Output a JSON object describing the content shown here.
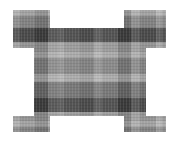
{
  "image": {
    "title": "Grayscale plaid textured cross shape",
    "width": 176,
    "height": 145,
    "background_color": "#ffffff",
    "description": "A square block of black-and-white tartan/plaid fabric texture with rectangular notches cut out of the centre of each of its four sides, forming a cross / plus-like silhouette.",
    "alt_text": "Plaid patterned cross shape on white background"
  },
  "shape": {
    "name": "notched-square-cross",
    "outer_bounds": {
      "x": 13,
      "y": 10,
      "width": 153,
      "height": 122
    },
    "notches": [
      {
        "side": "top",
        "x": 50,
        "y": 10,
        "width": 74,
        "height": 18
      },
      {
        "side": "bottom",
        "x": 50,
        "y": 116,
        "width": 74,
        "height": 16
      },
      {
        "side": "left",
        "x": 13,
        "y": 48,
        "width": 21,
        "height": 68
      },
      {
        "side": "right",
        "x": 146,
        "y": 48,
        "width": 20,
        "height": 68
      }
    ],
    "polygon_points": "13,10 50,10 50,28 124,28 124,10 166,10 166,48 146,48 146,116 166,116 166,132 124,132 124,116 50,116 50,132 13,132 13,116 34,116 34,48 13,48"
  },
  "pattern": {
    "type": "plaid-tartan",
    "orientation": "orthogonal-weave",
    "base_color": "#8e8e8e",
    "colors": {
      "darkest": "#2b2b2b",
      "dark": "#4a4a4a",
      "mid_dark": "#6b6b6b",
      "mid": "#8a8a8a",
      "light": "#a8a8a8",
      "lighter": "#c2c2c2",
      "lightest": "#e2e2e2"
    },
    "vertical_bands": [
      {
        "x": 13,
        "width": 7,
        "tone": "light"
      },
      {
        "x": 20,
        "width": 15,
        "tone": "mid_dark"
      },
      {
        "x": 35,
        "width": 13,
        "tone": "darkest"
      },
      {
        "x": 48,
        "width": 10,
        "tone": "light"
      },
      {
        "x": 58,
        "width": 6,
        "tone": "lighter"
      },
      {
        "x": 64,
        "width": 16,
        "tone": "mid"
      },
      {
        "x": 80,
        "width": 14,
        "tone": "mid_dark"
      },
      {
        "x": 94,
        "width": 8,
        "tone": "lighter"
      },
      {
        "x": 102,
        "width": 16,
        "tone": "mid"
      },
      {
        "x": 118,
        "width": 13,
        "tone": "darkest"
      },
      {
        "x": 131,
        "width": 9,
        "tone": "light"
      },
      {
        "x": 140,
        "width": 16,
        "tone": "mid_dark"
      },
      {
        "x": 156,
        "width": 6,
        "tone": "lighter"
      },
      {
        "x": 162,
        "width": 4,
        "tone": "mid"
      }
    ],
    "horizontal_bands": [
      {
        "y": 10,
        "height": 6,
        "tone": "lighter"
      },
      {
        "y": 16,
        "height": 12,
        "tone": "mid"
      },
      {
        "y": 28,
        "height": 14,
        "tone": "darkest"
      },
      {
        "y": 42,
        "height": 10,
        "tone": "light"
      },
      {
        "y": 52,
        "height": 6,
        "tone": "lighter"
      },
      {
        "y": 58,
        "height": 16,
        "tone": "mid"
      },
      {
        "y": 74,
        "height": 8,
        "tone": "lighter"
      },
      {
        "y": 82,
        "height": 16,
        "tone": "mid_dark"
      },
      {
        "y": 98,
        "height": 14,
        "tone": "darkest"
      },
      {
        "y": 112,
        "height": 9,
        "tone": "light"
      },
      {
        "y": 121,
        "height": 6,
        "tone": "lighter"
      },
      {
        "y": 127,
        "height": 5,
        "tone": "mid"
      }
    ]
  }
}
